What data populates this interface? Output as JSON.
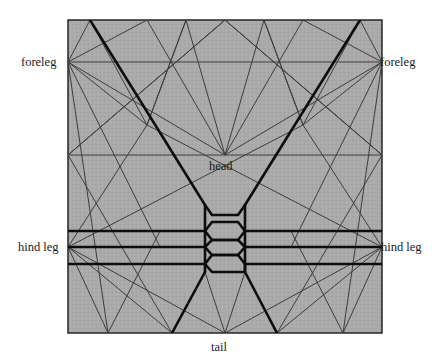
{
  "figure": {
    "kind": "origami-crease-pattern",
    "paper": {
      "fill_color": "#a8a8a8",
      "border_color": "#1a1a1a",
      "x": 68,
      "y": 20,
      "width": 314,
      "height": 313
    },
    "line_colors": {
      "thin": "#3a3a3a",
      "bold": "#101010"
    },
    "labels": [
      {
        "id": "foreleg-left",
        "text": "foreleg",
        "x": 21,
        "y": 56,
        "anchor": "left-edge-vertex"
      },
      {
        "id": "foreleg-right",
        "text": "foreleg",
        "x": 380,
        "y": 56,
        "anchor": "right-edge-vertex"
      },
      {
        "id": "head",
        "text": "head",
        "x": 209,
        "y": 160,
        "anchor": "center-vertex"
      },
      {
        "id": "hind-leg-left",
        "text": "hind leg",
        "x": 18,
        "y": 241,
        "anchor": "left-edge-vertex"
      },
      {
        "id": "hind-leg-right",
        "text": "hind leg",
        "x": 381,
        "y": 241,
        "anchor": "right-edge-vertex"
      },
      {
        "id": "tail",
        "text": "tail",
        "x": 211,
        "y": 341,
        "anchor": "bottom-edge-vertex"
      }
    ],
    "vertices": {
      "foreleg_left": [
        68,
        62
      ],
      "foreleg_right": [
        382,
        62
      ],
      "head": [
        225,
        155
      ],
      "hind_leg_left": [
        68,
        247
      ],
      "hind_leg_right": [
        382,
        247
      ],
      "tail": [
        225,
        333
      ]
    },
    "guide_lines_horizontal_y": [
      62,
      155,
      231,
      247,
      264
    ],
    "pleat_band_x": [
      205,
      245
    ]
  }
}
